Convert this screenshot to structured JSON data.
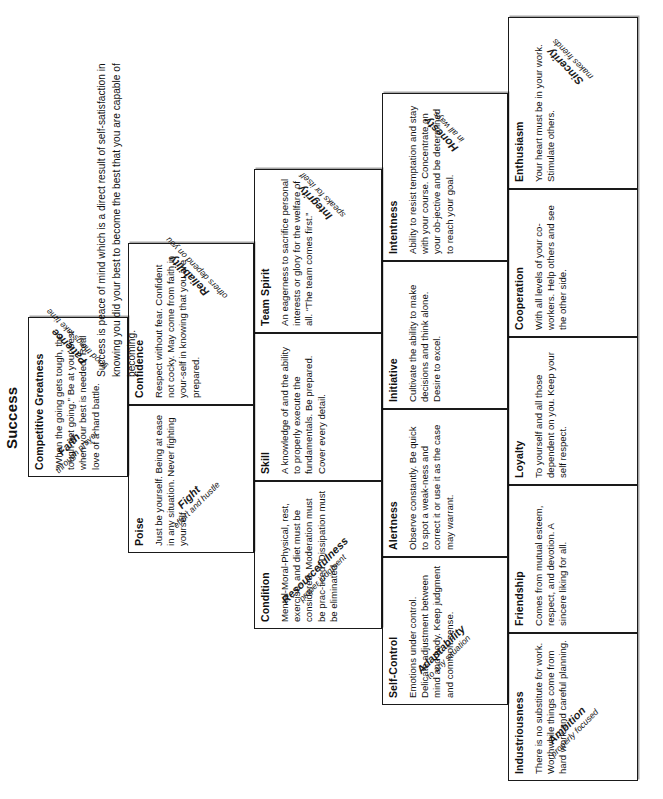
{
  "title": "Success",
  "definition": "Success is peace of mind which is a direct result of self-satisfaction in knowing you did your best to become the best that you are capable of becoming.",
  "diagram": {
    "name": "Pyramid of Success",
    "mortar_color": "#d9d9d9",
    "block_color": "#ffffff",
    "border_color": "#1a1a1a"
  },
  "tiers": [
    {
      "row": 5,
      "blocks": [
        {
          "title": "Competitive Greatness",
          "desc": "“When the going gets tough, the tough get going.” Be at your best when your best is needed. Real love of a hard battle."
        }
      ]
    },
    {
      "row": 4,
      "blocks": [
        {
          "title": "Poise",
          "desc": "Just be yourself. Being at ease in any situation. Never fighting yourself."
        },
        {
          "title": "Confidence",
          "desc": "Respect without fear. Confident not cocky. May come from faith in your-self in knowing that you are prepared."
        }
      ]
    },
    {
      "row": 3,
      "blocks": [
        {
          "title": "Condition",
          "desc": "Mental-Moral-Physical, rest, exercise, and diet must be considered. Moderation must be prac-ticed. Dissipation must be eliminated."
        },
        {
          "title": "Skill",
          "desc": "A knowledge of and the ability to properly execute the fundamentals. Be prepared. Cover every detail."
        },
        {
          "title": "Team Spirit",
          "desc": "An eagerness to sacrifice personal interests or glory for the welfare of all. “The team comes first.”"
        }
      ]
    },
    {
      "row": 2,
      "blocks": [
        {
          "title": "Self-Control",
          "desc": "Emotions under control. Delicate adjustment between mind and body. Keep judgment and common sense."
        },
        {
          "title": "Alertness",
          "desc": "Observe constantly. Be quick to spot a weak-ness and correct it or use it as the case may warrant."
        },
        {
          "title": "Initiative",
          "desc": "Cultivate the ability to make decisions and think alone. Desire to excel."
        },
        {
          "title": "Intentness",
          "desc": "Ability to resist temptation and stay with your course. Concentrate on your ob-jective and be determined to reach your goal."
        }
      ]
    },
    {
      "row": 1,
      "blocks": [
        {
          "title": "Industriousness",
          "desc": "There is no substitute for work. Worthwhile things come from hard work and careful planning."
        },
        {
          "title": "Friendship",
          "desc": "Comes from mutual esteem, respect, and devotion. A sincere liking for all."
        },
        {
          "title": "Loyalty",
          "desc": "To yourself and all those dependent on you. Keep your self respect."
        },
        {
          "title": "Cooperation",
          "desc": "With all levels of your co-workers. Help others and see the other side."
        },
        {
          "title": "Enthusiasm",
          "desc": "Your heart must be in your work. Stimulate others."
        }
      ]
    }
  ],
  "mortar_left": [
    {
      "title": "Ambition",
      "sub": "properly focused"
    },
    {
      "title": "Adaptability",
      "sub": "to any situation"
    },
    {
      "title": "Resourcefulness",
      "sub": "proper judgment"
    },
    {
      "title": "Fight",
      "sub": "effort and hustle"
    },
    {
      "title": "Faith",
      "sub": "through prayer"
    }
  ],
  "mortar_right": [
    {
      "title": "Sincerity",
      "sub": "makes friends"
    },
    {
      "title": "Honesty",
      "sub": "in all ways"
    },
    {
      "title": "Integrity",
      "sub": "speaks for itself"
    },
    {
      "title": "Reliability",
      "sub": "others depend on you"
    },
    {
      "title": "Patience",
      "sub": "good things take time"
    }
  ]
}
